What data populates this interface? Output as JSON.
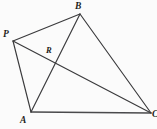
{
  "figure": {
    "background_color": "#fbfbfb",
    "stroke_color": "#3a3a3c",
    "label_color": "#1e1e20",
    "width": 157,
    "height": 129
  },
  "points": {
    "P": {
      "label": "P",
      "x": 13,
      "y": 41,
      "label_x": 3,
      "label_y": 30
    },
    "B": {
      "label": "B",
      "x": 80,
      "y": 14,
      "label_x": 75,
      "label_y": 2
    },
    "A": {
      "label": "A",
      "x": 31,
      "y": 112,
      "label_x": 20,
      "label_y": 116
    },
    "C": {
      "label": "C",
      "x": 151,
      "y": 113,
      "label_x": 152,
      "label_y": 110
    },
    "R": {
      "label": "R",
      "x": 53,
      "y": 64,
      "label_x": 46,
      "label_y": 46
    }
  },
  "segments": [
    {
      "name": "segment-P-B",
      "from": "P",
      "to": "B"
    },
    {
      "name": "segment-B-C",
      "from": "B",
      "to": "C"
    },
    {
      "name": "segment-A-C",
      "from": "A",
      "to": "C"
    },
    {
      "name": "segment-A-P",
      "from": "A",
      "to": "P"
    },
    {
      "name": "segment-A-B",
      "from": "A",
      "to": "B"
    },
    {
      "name": "segment-P-C",
      "from": "P",
      "to": "C"
    }
  ],
  "labels": {
    "P": "P",
    "B": "B",
    "R": "R",
    "A": "A",
    "C": "C"
  }
}
